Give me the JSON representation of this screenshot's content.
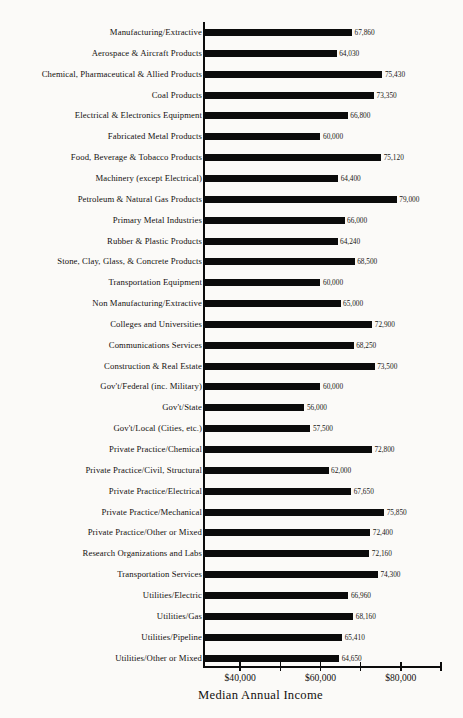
{
  "chart_data": {
    "type": "bar",
    "orientation": "horizontal",
    "title": "",
    "xlabel": "Median Annual Income",
    "ylabel": "",
    "xlim": [
      31000,
      90000
    ],
    "grid": false,
    "legend": null,
    "tick_labels": [
      "$40,000",
      "$60,000",
      "$80,000"
    ],
    "tick_values": [
      40000,
      60000,
      80000
    ],
    "minor_tick_values": [
      50000,
      70000,
      90000
    ],
    "value_label_format": "comma",
    "bar_color": "#0b0b0b",
    "categories": [
      "Manufacturing/Extractive",
      "Aerospace & Aircraft Products",
      "Chemical, Pharmaceutical & Allied Products",
      "Coal Products",
      "Electrical & Electronics Equipment",
      "Fabricated Metal Products",
      "Food, Beverage & Tobacco Products",
      "Machinery (except Electrical)",
      "Petroleum & Natural Gas Products",
      "Primary Metal Industries",
      "Rubber & Plastic Products",
      "Stone, Clay, Glass, & Concrete Products",
      "Transportation Equipment",
      "Non Manufacturing/Extractive",
      "Colleges and Universities",
      "Communications Services",
      "Construction & Real Estate",
      "Gov't/Federal (inc. Military)",
      "Gov't/State",
      "Gov't/Local (Cities, etc.)",
      "Private Practice/Chemical",
      "Private Practice/Civil, Structural",
      "Private Practice/Electrical",
      "Private Practice/Mechanical",
      "Private Practice/Other or Mixed",
      "Research Organizations and Labs",
      "Transportation Services",
      "Utilities/Electric",
      "Utilities/Gas",
      "Utilities/Pipeline",
      "Utilities/Other or Mixed"
    ],
    "values": [
      67860,
      64030,
      75430,
      73350,
      66800,
      60000,
      75120,
      64400,
      79000,
      66000,
      64240,
      68500,
      60000,
      65000,
      72900,
      68250,
      73500,
      60000,
      56000,
      57500,
      72800,
      62000,
      67650,
      75850,
      72400,
      72160,
      74300,
      66960,
      68160,
      65410,
      64650
    ],
    "value_labels": [
      "67,860",
      "64,030",
      "75,430",
      "73,350",
      "66,800",
      "60,000",
      "75,120",
      "64,400",
      "79,000",
      "66,000",
      "64,240",
      "68,500",
      "60,000",
      "65,000",
      "72,900",
      "68,250",
      "73,500",
      "60,000",
      "56,000",
      "57,500",
      "72,800",
      "62,000",
      "67,650",
      "75,850",
      "72,400",
      "72,160",
      "74,300",
      "66,960",
      "68,160",
      "65,410",
      "64,650"
    ]
  }
}
